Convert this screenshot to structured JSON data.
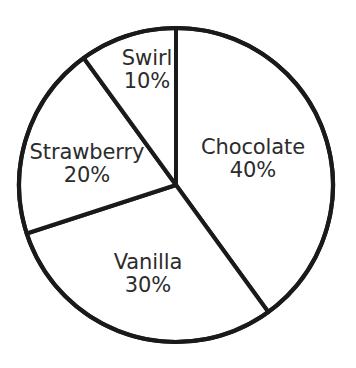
{
  "chart_data": {
    "type": "pie",
    "title": "",
    "subtitle": "",
    "xlabel": "",
    "ylabel": "",
    "legend_position": "none",
    "grid": false,
    "units": "percent",
    "start_angle_deg": 0,
    "direction": "clockwise",
    "categories": [
      "Chocolate",
      "Vanilla",
      "Strawberry",
      "Swirl"
    ],
    "values": [
      40,
      30,
      20,
      10
    ],
    "slices": [
      {
        "label": "Chocolate",
        "value": 40,
        "value_text": "40%",
        "start_deg": 0,
        "end_deg": 144,
        "fill": "#ffffff",
        "stroke": "#1a1a1a"
      },
      {
        "label": "Vanilla",
        "value": 30,
        "value_text": "30%",
        "start_deg": 144,
        "end_deg": 252,
        "fill": "#ffffff",
        "stroke": "#1a1a1a"
      },
      {
        "label": "Strawberry",
        "value": 20,
        "value_text": "20%",
        "start_deg": 252,
        "end_deg": 324,
        "fill": "#ffffff",
        "stroke": "#1a1a1a"
      },
      {
        "label": "Swirl",
        "value": 10,
        "value_text": "10%",
        "start_deg": 324,
        "end_deg": 360,
        "fill": "#ffffff",
        "stroke": "#1a1a1a"
      }
    ]
  },
  "figure": {
    "background": "#ffffff",
    "stroke_color": "#1a1a1a",
    "text_color": "#2b2b2b",
    "center_x": 176,
    "center_y": 185,
    "radius": 157
  }
}
